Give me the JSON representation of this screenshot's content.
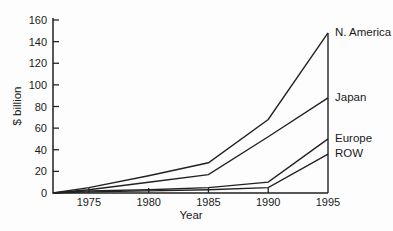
{
  "chart_data": {
    "type": "line",
    "title": "",
    "xlabel": "Year",
    "ylabel": "$ billion",
    "xlim": [
      1972,
      1995
    ],
    "ylim": [
      0,
      160
    ],
    "x_ticks": [
      1975,
      1980,
      1985,
      1990,
      1995
    ],
    "y_ticks": [
      0,
      20,
      40,
      60,
      80,
      100,
      120,
      140,
      160
    ],
    "grid": "off",
    "legend_position": "right-of-plot-end-labels",
    "line_color": "#222222",
    "text_color": "#1a1a1a",
    "background_color": "#fdfdfd",
    "series": [
      {
        "name": "N. America",
        "points": [
          [
            1972,
            0
          ],
          [
            1975,
            5
          ],
          [
            1980,
            16
          ],
          [
            1985,
            28
          ],
          [
            1990,
            68
          ],
          [
            1995,
            148
          ]
        ]
      },
      {
        "name": "Japan",
        "points": [
          [
            1972,
            0
          ],
          [
            1975,
            3
          ],
          [
            1980,
            10
          ],
          [
            1985,
            17
          ],
          [
            1990,
            52
          ],
          [
            1995,
            88
          ]
        ]
      },
      {
        "name": "Europe",
        "points": [
          [
            1972,
            0
          ],
          [
            1975,
            2
          ],
          [
            1980,
            3
          ],
          [
            1985,
            5
          ],
          [
            1990,
            10
          ],
          [
            1995,
            50
          ]
        ]
      },
      {
        "name": "ROW",
        "points": [
          [
            1972,
            0
          ],
          [
            1975,
            1
          ],
          [
            1980,
            2
          ],
          [
            1985,
            3
          ],
          [
            1990,
            5
          ],
          [
            1995,
            36
          ]
        ]
      }
    ]
  }
}
